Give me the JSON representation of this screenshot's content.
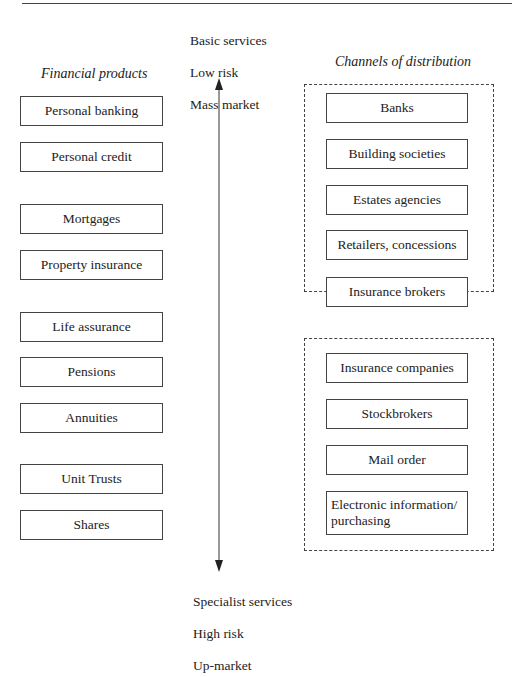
{
  "left_column": {
    "heading": "Financial products",
    "items": [
      "Personal banking",
      "Personal credit",
      "Mortgages",
      "Property insurance",
      "Life assurance",
      "Pensions",
      "Annuities",
      "Unit Trusts",
      "Shares"
    ]
  },
  "right_column": {
    "heading": "Channels of distribution",
    "group1": [
      "Banks",
      "Building societies",
      "Estates agencies",
      "Retailers, concessions",
      "Insurance brokers"
    ],
    "group2": [
      "Insurance companies",
      "Stockbrokers",
      "Mail order"
    ],
    "group2_multiline": [
      "Electronic information/",
      "purchasing"
    ]
  },
  "axis": {
    "top": [
      "Basic services",
      "Low risk",
      "Mass market"
    ],
    "bottom": [
      "Specialist services",
      "High risk",
      "Up-market"
    ]
  }
}
